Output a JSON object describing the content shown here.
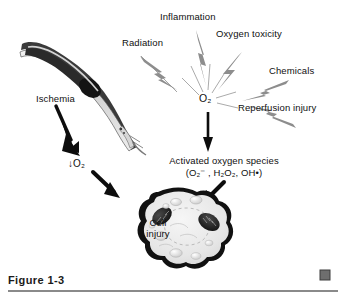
{
  "figure": {
    "caption": "Figure 1-3",
    "marker_color": "#6e6e6e",
    "rule_color": "#8a8a8a",
    "background": "#ffffff"
  },
  "diagram": {
    "title_center": "O2",
    "center_label_html": "O₂",
    "sources": [
      {
        "name": "radiation",
        "label": "Radiation"
      },
      {
        "name": "inflammation",
        "label": "Inflammation"
      },
      {
        "name": "oxygen-toxicity",
        "label": "Oxygen toxicity"
      },
      {
        "name": "chemicals",
        "label": "Chemicals"
      },
      {
        "name": "reperfusion-injury",
        "label": "Reperfusion injury"
      }
    ],
    "ischemia": {
      "label": "Ischemia",
      "effect_label": "↓O₂"
    },
    "activated_oxygen_species": {
      "line1": "Activated oxygen species",
      "line2": "(O₂⁻ , H₂O₂, OH•)"
    },
    "cell": {
      "line1": "Cell",
      "line2": "injury"
    },
    "colors": {
      "ink": "#101010",
      "bolt_gray": "#8d8d8d",
      "vessel_dark": "#3a3a3a",
      "vessel_light": "#c9c9c9",
      "cell_fill": "#e8e8e8",
      "mitochondria": "#1a1a1a"
    }
  }
}
